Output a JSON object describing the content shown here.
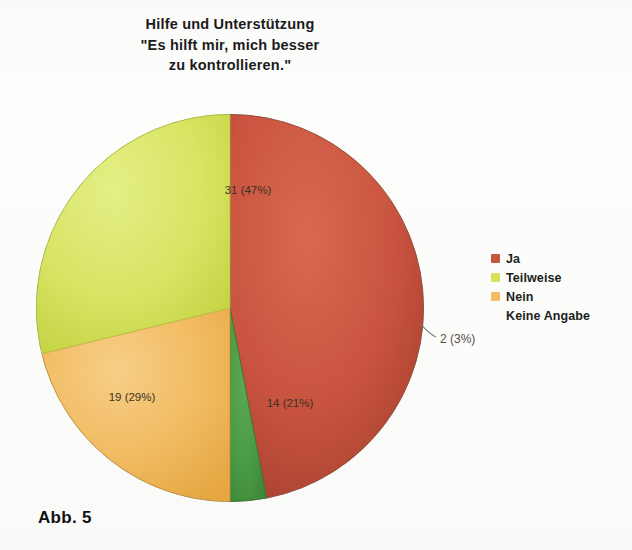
{
  "figure": {
    "caption": "Abb. 5",
    "title_lines": [
      "Hilfe und Unterstützung",
      "\"Es hilft mir, mich besser",
      "zu kontrollieren.\""
    ],
    "title_text": "Hilfe und Unterstützung \"Es hilft mir, mich besser zu kontrollieren.\""
  },
  "legend": {
    "position": "right",
    "items": [
      {
        "label": "Ja",
        "color": "#c9543f",
        "swatch_name": "legend-swatch-ja"
      },
      {
        "label": "Teilweise",
        "color": "#d7e35c",
        "swatch_name": "legend-swatch-teilweise"
      },
      {
        "label": "Nein",
        "color": "#f3bd63",
        "swatch_name": "legend-swatch-nein"
      },
      {
        "label": "Keine Angabe",
        "color": "#4a9a४4",
        "swatch_name": "legend-swatch-keine-angabe"
      }
    ]
  },
  "chart_data": {
    "type": "pie",
    "title": "Hilfe und Unterstützung \"Es hilft mir, mich besser zu kontrollieren.\"",
    "xlabel": "",
    "ylabel": "",
    "total": 66,
    "start_angle_deg": 0,
    "direction": "clockwise",
    "legend_position": "right",
    "categories": [
      "Ja",
      "Teilweise",
      "Nein",
      "Keine Angabe"
    ],
    "values": [
      31,
      19,
      14,
      2
    ],
    "percentages": [
      47,
      29,
      21,
      3
    ],
    "colors": [
      "#c9543f",
      "#d7e35c",
      "#f3bd63",
      "#4a9a44"
    ],
    "slices": [
      {
        "name": "Ja",
        "value": 31,
        "percent": 47,
        "label": "31 (47%)",
        "color": "#c9543f",
        "label_placement": "inside"
      },
      {
        "name": "Keine Angabe",
        "value": 2,
        "percent": 3,
        "label": "2 (3%)",
        "color": "#4a9a44",
        "label_placement": "outside"
      },
      {
        "name": "Nein",
        "value": 14,
        "percent": 21,
        "label": "14 (21%)",
        "color": "#f3bd63",
        "label_placement": "inside"
      },
      {
        "name": "Teilweise",
        "value": 19,
        "percent": 29,
        "label": "19 (29%)",
        "color": "#d7e35c",
        "label_placement": "inside"
      }
    ]
  }
}
